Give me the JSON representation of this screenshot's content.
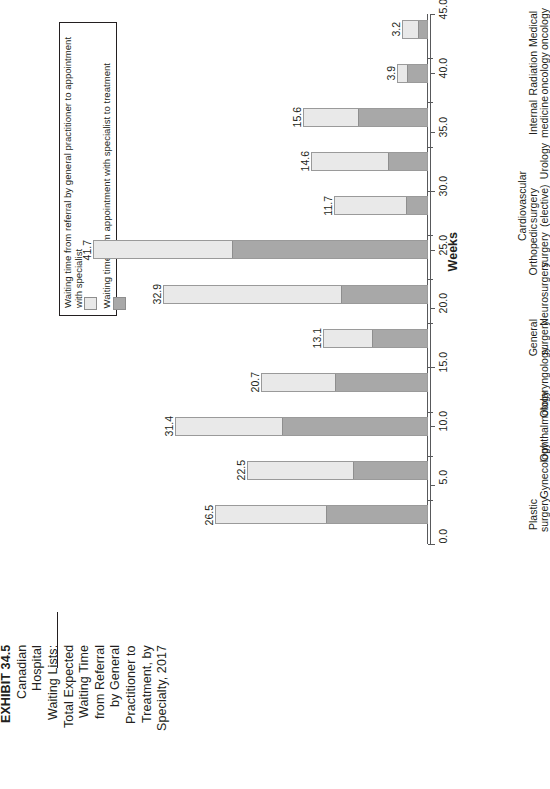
{
  "exhibit": {
    "lines": [
      "EXHIBIT 34.5",
      "Canadian",
      "Hospital",
      "Waiting Lists:",
      "Total Expected",
      "Waiting Time",
      "from Referral",
      "by General",
      "Practitioner to",
      "Treatment, by",
      "Specialty, 2017"
    ]
  },
  "legend": {
    "items": [
      {
        "label": "Waiting time from referral by general practitioner to appointment with specialist",
        "color": "#e9e9e9",
        "key": "referral-to-specialist"
      },
      {
        "label": "Waiting time from appointment with specialist to treatment",
        "color": "#a8a8a8",
        "key": "specialist-to-treatment"
      }
    ]
  },
  "chart_data": {
    "type": "bar",
    "orientation": "horizontal",
    "stacked": true,
    "xlabel": "Weeks",
    "ylabel": "",
    "xlim": [
      0,
      45
    ],
    "xticks": [
      "0.0",
      "5.0",
      "10.0",
      "15.0",
      "20.0",
      "25.0",
      "30.0",
      "35.0",
      "40.0",
      "45.0"
    ],
    "grid": false,
    "legend_position": "top-left",
    "categories": [
      "Medical oncology",
      "Radiation oncology",
      "Internal medicine",
      "Urology",
      "Cardiovascular surgery (elective)",
      "Orthopedic surgery",
      "Neurosurgery",
      "General surgery",
      "Otolaryngology",
      "Ophthalmology",
      "Gynecology",
      "Plastic surgery"
    ],
    "series": [
      {
        "name": "Waiting time from referral by general practitioner to appointment with specialist",
        "color": "#e9e9e9",
        "values": [
          2.1,
          1.4,
          7.0,
          9.8,
          9.2,
          17.4,
          22.2,
          6.2,
          9.3,
          13.4,
          13.3,
          14.0
        ]
      },
      {
        "name": "Waiting time from appointment with specialist to treatment",
        "color": "#a8a8a8",
        "values": [
          1.1,
          2.5,
          8.6,
          4.8,
          2.5,
          24.3,
          10.7,
          6.9,
          11.4,
          18.0,
          9.2,
          12.5
        ]
      }
    ],
    "totals": [
      3.2,
      3.9,
      15.6,
      14.6,
      11.7,
      41.7,
      32.9,
      13.1,
      20.7,
      31.4,
      22.5,
      26.5
    ],
    "total_labels": [
      "3.2",
      "3.9",
      "15.6",
      "14.6",
      "11.7",
      "41.7",
      "32.9",
      "13.1",
      "20.7",
      "31.4",
      "22.5",
      "26.5"
    ],
    "category_label_lines": [
      [
        "Medical oncology"
      ],
      [
        "Radiation oncology"
      ],
      [
        "Internal medicine"
      ],
      [
        "Urology"
      ],
      [
        "Cardiovascular surgery",
        "(elective)"
      ],
      [
        "Orthopedic surgery"
      ],
      [
        "Neurosurgery"
      ],
      [
        "General surgery"
      ],
      [
        "Otolaryngology"
      ],
      [
        "Ophthalmology"
      ],
      [
        "Gynecology"
      ],
      [
        "Plastic surgery"
      ]
    ]
  }
}
